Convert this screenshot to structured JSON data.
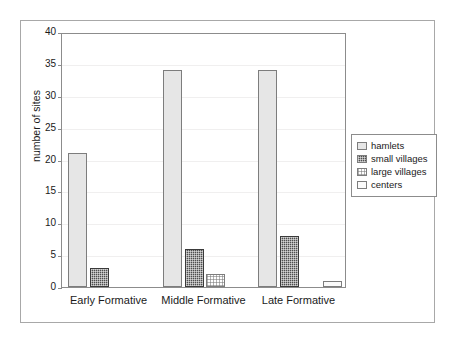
{
  "chart_data": {
    "type": "bar",
    "title": "",
    "subtitle": "",
    "xlabel": "",
    "ylabel": "number of sites",
    "categories": [
      "Early Formative",
      "Middle Formative",
      "Late Formative"
    ],
    "series": [
      {
        "name": "hamlets",
        "values": [
          21,
          34,
          34
        ],
        "swatch": "#e6e6e6",
        "pattern": "solid-light"
      },
      {
        "name": "small villages",
        "values": [
          3,
          6,
          8
        ],
        "swatch": "#4f4f4f",
        "pattern": "dark-speckled"
      },
      {
        "name": "large villages",
        "values": [
          0,
          2,
          0
        ],
        "swatch": "#ffffff",
        "pattern": "light-checker"
      },
      {
        "name": "centers",
        "values": [
          0,
          0,
          1
        ],
        "swatch": "#fbfbfb",
        "pattern": "solid-white"
      }
    ],
    "ylim": [
      0,
      40
    ],
    "yticks": [
      0,
      5,
      10,
      15,
      20,
      25,
      30,
      35,
      40
    ],
    "ytick_labels": [
      "0",
      "5",
      "10",
      "15",
      "20",
      "25",
      "30",
      "35",
      "40"
    ],
    "grid": true,
    "legend_position": "right",
    "legend_entries": [
      "hamlets",
      "small villages",
      "large villages",
      "centers"
    ]
  },
  "axes": {
    "y_title": "number of sites"
  },
  "legend": {
    "items": [
      {
        "label": "hamlets"
      },
      {
        "label": "small villages"
      },
      {
        "label": "large villages"
      },
      {
        "label": "centers"
      }
    ]
  }
}
